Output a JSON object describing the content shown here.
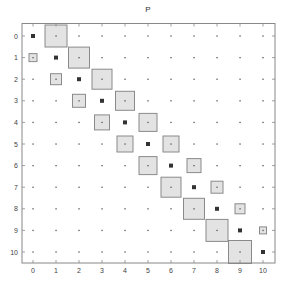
{
  "chart_data": {
    "type": "hinton",
    "title": "P",
    "xlabel": "",
    "ylabel": "",
    "x_ticks": [
      0,
      1,
      2,
      3,
      4,
      5,
      6,
      7,
      8,
      9,
      10
    ],
    "y_ticks": [
      0,
      1,
      2,
      3,
      4,
      5,
      6,
      7,
      8,
      9,
      10
    ],
    "xlim": [
      -0.5,
      10.5
    ],
    "ylim": [
      10.5,
      -0.5
    ],
    "grid": false,
    "legend": null,
    "note": "Matrix plot: tiny dots at every cell, dark squares on diagonal, gray boxes (size ∝ magnitude) on off-diagonals",
    "colors": {
      "box_fill": "#e3e3e3",
      "box_edge": "#8a8a8a",
      "diag_marker": "#333333",
      "dot": "#555555",
      "frame": "#888888"
    },
    "diagonal": [
      0,
      1,
      2,
      3,
      4,
      5,
      6,
      7,
      8,
      9,
      10
    ],
    "boxes": [
      {
        "row": 0,
        "col": 1,
        "size": 22
      },
      {
        "row": 1,
        "col": 0,
        "size": 8
      },
      {
        "row": 1,
        "col": 2,
        "size": 21
      },
      {
        "row": 2,
        "col": 1,
        "size": 11
      },
      {
        "row": 2,
        "col": 3,
        "size": 20
      },
      {
        "row": 3,
        "col": 2,
        "size": 13
      },
      {
        "row": 3,
        "col": 4,
        "size": 19
      },
      {
        "row": 4,
        "col": 3,
        "size": 15
      },
      {
        "row": 4,
        "col": 5,
        "size": 18
      },
      {
        "row": 5,
        "col": 4,
        "size": 16
      },
      {
        "row": 5,
        "col": 6,
        "size": 16
      },
      {
        "row": 6,
        "col": 5,
        "size": 18
      },
      {
        "row": 6,
        "col": 7,
        "size": 14
      },
      {
        "row": 7,
        "col": 6,
        "size": 20
      },
      {
        "row": 7,
        "col": 8,
        "size": 12
      },
      {
        "row": 8,
        "col": 7,
        "size": 21
      },
      {
        "row": 8,
        "col": 9,
        "size": 10
      },
      {
        "row": 9,
        "col": 8,
        "size": 22
      },
      {
        "row": 9,
        "col": 10,
        "size": 7
      },
      {
        "row": 10,
        "col": 9,
        "size": 23
      }
    ]
  }
}
